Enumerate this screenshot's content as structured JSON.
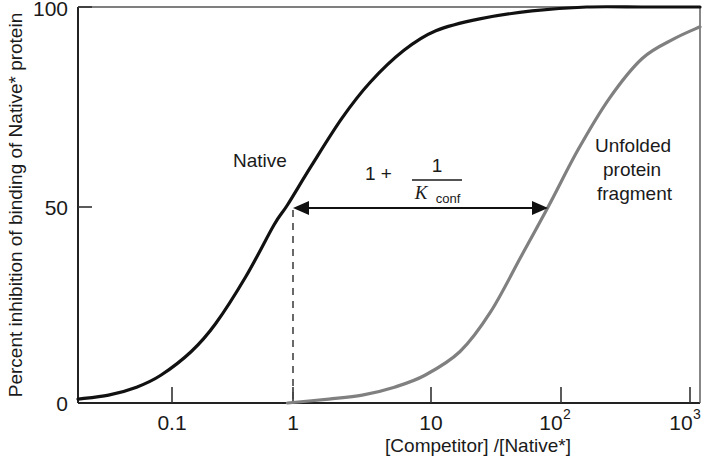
{
  "chart_data": {
    "type": "line",
    "title": "",
    "xlabel": "[Competitor] /[Native*]",
    "ylabel": "Percent inhibition of binding of Native* protein",
    "xscale": "log",
    "xlim": [
      0.03,
      1000
    ],
    "ylim": [
      0,
      100
    ],
    "grid": false,
    "legend_position": "inline-annotation",
    "x_ticks": [
      {
        "value": 0.1,
        "label": "0.1",
        "sup": ""
      },
      {
        "value": 1,
        "label": "1",
        "sup": ""
      },
      {
        "value": 10,
        "label": "10",
        "sup": ""
      },
      {
        "value": 100,
        "label": "10",
        "sup": "2"
      },
      {
        "value": 1000,
        "label": "10",
        "sup": "3"
      }
    ],
    "y_ticks": [
      {
        "value": 0,
        "label": "0"
      },
      {
        "value": 50,
        "label": "50"
      },
      {
        "value": 100,
        "label": "100"
      }
    ],
    "series": [
      {
        "name": "Native",
        "color": "#111111",
        "label": "Native",
        "midpoint_x": 1,
        "x": [
          0.03,
          0.05,
          0.08,
          0.12,
          0.2,
          0.3,
          0.5,
          0.8,
          1.0,
          1.5,
          2.5,
          4,
          7,
          12,
          25,
          60,
          150,
          400,
          1000
        ],
        "values": [
          1,
          2,
          4,
          7,
          13,
          20,
          32,
          45,
          50,
          60,
          72,
          81,
          89,
          94,
          97,
          99,
          100,
          100,
          100
        ]
      },
      {
        "name": "Unfolded protein fragment",
        "color": "#808080",
        "label": "Unfolded\nprotein\nfragment",
        "label_lines": [
          "Unfolded",
          "protein",
          "fragment"
        ],
        "midpoint_x": 80,
        "x": [
          1.0,
          2,
          3.5,
          6,
          10,
          18,
          30,
          50,
          80,
          130,
          220,
          380,
          650,
          1000
        ],
        "values": [
          0,
          1,
          2,
          4,
          7,
          13,
          23,
          37,
          50,
          64,
          77,
          87,
          92,
          95
        ]
      }
    ],
    "annotation": {
      "type": "double-arrow",
      "at_y": 50,
      "from_x": 1,
      "to_x": 80,
      "formula": {
        "lead": "1 +",
        "numerator": "1",
        "denominator_symbol": "K",
        "denominator_subscript": "conf"
      }
    }
  }
}
